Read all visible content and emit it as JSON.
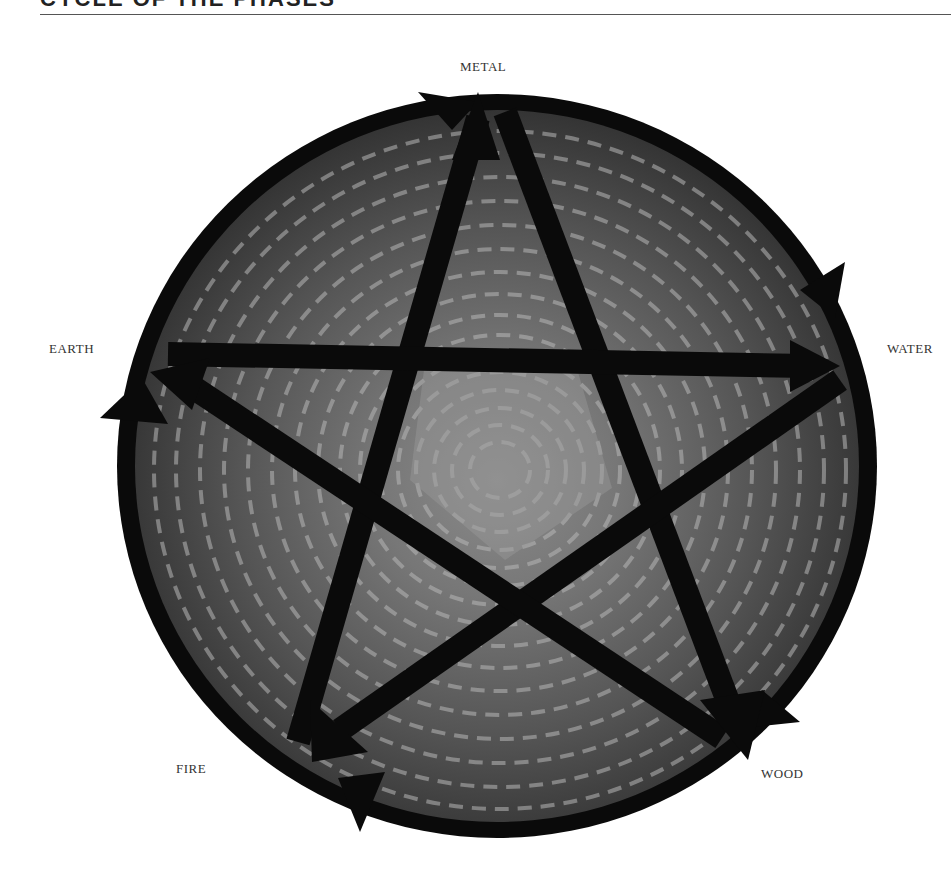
{
  "header": {
    "title": "CYCLE OF THE PHASES"
  },
  "diagram": {
    "type": "five-phase-cycle",
    "colors": {
      "ring": "#0a0a0a",
      "star": "#0a0a0a",
      "texture_dark": "#3a3a3a",
      "texture_mid": "#6e6e6e",
      "texture_light": "#a8a8a8",
      "background": "#ffffff",
      "label": "#333333"
    },
    "elements": [
      {
        "id": "metal",
        "label": "METAL",
        "position": "top"
      },
      {
        "id": "water",
        "label": "WATER",
        "position": "right"
      },
      {
        "id": "wood",
        "label": "WOOD",
        "position": "bottom-right"
      },
      {
        "id": "fire",
        "label": "FIRE",
        "position": "bottom-left"
      },
      {
        "id": "earth",
        "label": "EARTH",
        "position": "left"
      }
    ],
    "generating_cycle": [
      "METAL",
      "WATER",
      "WOOD",
      "FIRE",
      "EARTH",
      "METAL"
    ],
    "controlling_cycle": [
      {
        "from": "METAL",
        "to": "WOOD"
      },
      {
        "from": "WOOD",
        "to": "EARTH"
      },
      {
        "from": "EARTH",
        "to": "WATER"
      },
      {
        "from": "WATER",
        "to": "FIRE"
      },
      {
        "from": "FIRE",
        "to": "METAL"
      }
    ]
  }
}
